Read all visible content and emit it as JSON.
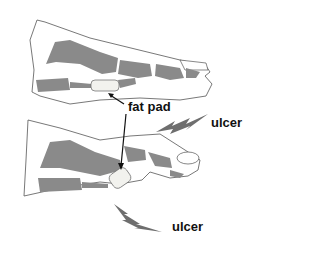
{
  "labels": {
    "fat_pad": "fat pad",
    "ulcer_top": "ulcer",
    "ulcer_bottom": "ulcer"
  },
  "colors": {
    "bone": "#8a8a8a",
    "outline": "#555555",
    "fat_pad": "#f2f2ee",
    "arrow": "#111111",
    "lightning": "#6e6e6e"
  }
}
